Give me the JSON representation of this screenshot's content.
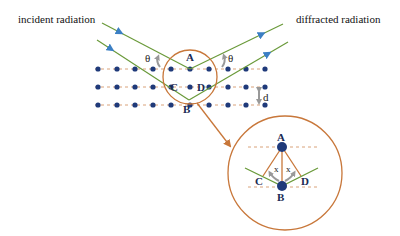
{
  "labels": {
    "incident": "incident radiation",
    "diffracted": "diffracted radiation",
    "theta": "θ",
    "d": "d",
    "x": "x",
    "point_a": "A",
    "point_b": "B",
    "point_c": "C",
    "point_d": "D"
  },
  "colors": {
    "dot": "#1f3a7a",
    "beam": "#6a9a3a",
    "arrowhead": "#3b7fc4",
    "circle": "#c8773a",
    "dash": "#d9a27a",
    "angle_arrow": "#999999"
  },
  "lattice": {
    "rows_y": [
      69,
      87,
      105
    ],
    "cols_x": [
      98,
      117,
      135,
      153,
      171,
      190,
      209,
      228,
      246,
      265
    ]
  }
}
